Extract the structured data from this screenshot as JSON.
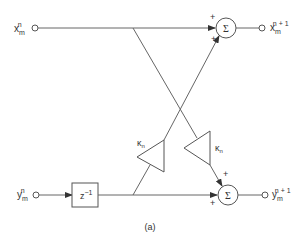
{
  "diagram": {
    "inputs": {
      "x": {
        "base": "x",
        "sub": "m",
        "sup": "n"
      },
      "y": {
        "base": "y",
        "sub": "m",
        "sup": "n"
      }
    },
    "outputs": {
      "x": {
        "base": "x",
        "sub": "m",
        "sup": "n + 1"
      },
      "y": {
        "base": "y",
        "sub": "m",
        "sup": "n + 1"
      }
    },
    "delay": {
      "label": "z",
      "exp": "−1"
    },
    "gains": {
      "left": {
        "symbol": "κ",
        "sub": "n"
      },
      "right": {
        "symbol": "κ",
        "sub": "n"
      }
    },
    "summers": {
      "top": {
        "symbol": "Σ",
        "signs": [
          "+",
          "+"
        ]
      },
      "bottom": {
        "symbol": "Σ",
        "signs": [
          "+",
          "+"
        ]
      }
    },
    "caption": "(a)",
    "colors": {
      "stroke": "#555555",
      "text": "#333333"
    }
  }
}
